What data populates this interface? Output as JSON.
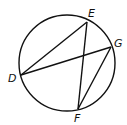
{
  "diagram": {
    "type": "circle-with-chords",
    "circle": {
      "cx": 67,
      "cy": 63,
      "r": 48
    },
    "points": {
      "D": {
        "x": 21,
        "y": 75,
        "label": "D",
        "lx": 8,
        "ly": 82
      },
      "E": {
        "x": 87,
        "y": 22,
        "label": "E",
        "lx": 88,
        "ly": 17
      },
      "G": {
        "x": 111,
        "y": 47,
        "label": "G",
        "lx": 114,
        "ly": 47
      },
      "F": {
        "x": 78,
        "y": 109,
        "label": "F",
        "lx": 74,
        "ly": 122
      }
    },
    "segments": [
      [
        "D",
        "E"
      ],
      [
        "D",
        "G"
      ],
      [
        "E",
        "F"
      ],
      [
        "G",
        "F"
      ]
    ],
    "stroke_color": "#111111"
  }
}
